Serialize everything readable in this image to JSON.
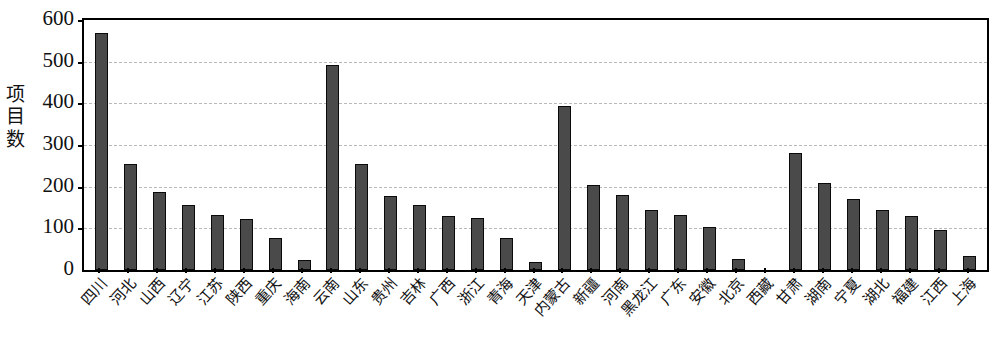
{
  "chart_data": {
    "type": "bar",
    "title": "",
    "subtitle": "",
    "xlabel": "",
    "ylabel": "项目数",
    "ylim": [
      0,
      600
    ],
    "ytick_values": [
      0,
      100,
      200,
      300,
      400,
      500,
      600
    ],
    "ytick_labels": [
      "0",
      "100",
      "200",
      "300",
      "400",
      "500",
      "600"
    ],
    "grid": true,
    "gridlines_axis": "y",
    "legend": false,
    "legend_position": "none",
    "bar_color": "#4a4a4a",
    "bar_edge_color": "#0a0a0a",
    "grid_color": "#b9b9b9",
    "axis_color": "#000000",
    "categories": [
      "四川",
      "河北",
      "山西",
      "辽宁",
      "江苏",
      "陕西",
      "重庆",
      "海南",
      "云南",
      "山东",
      "贵州",
      "吉林",
      "广西",
      "浙江",
      "青海",
      "天津",
      "内蒙古",
      "新疆",
      "河南",
      "黑龙江",
      "广东",
      "安徽",
      "北京",
      "西藏",
      "甘肃",
      "湖南",
      "宁夏",
      "湖北",
      "福建",
      "江西",
      "上海"
    ],
    "values": [
      570,
      255,
      188,
      157,
      133,
      122,
      78,
      25,
      492,
      255,
      178,
      155,
      130,
      124,
      78,
      20,
      393,
      205,
      180,
      145,
      131,
      103,
      27,
      0,
      280,
      208,
      170,
      145,
      130,
      97,
      33
    ]
  }
}
